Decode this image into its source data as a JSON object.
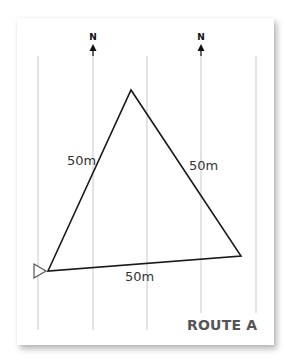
{
  "title": "ROUTE A",
  "colors": {
    "background": "#ffffff",
    "card": "#ffffff",
    "grid_line": "#c8c8c8",
    "route_line": "#1a1a1a",
    "route_title": "#555555",
    "text": "#333333"
  },
  "north_markers": [
    {
      "label": "N",
      "x": 93
    },
    {
      "label": "N",
      "x": 201
    }
  ],
  "grid_lines_x": [
    38,
    93,
    147,
    201,
    256
  ],
  "route": {
    "shape": "triangle",
    "vertices": [
      {
        "name": "start",
        "x": 48,
        "y": 271
      },
      {
        "name": "apex",
        "x": 131,
        "y": 90
      },
      {
        "name": "right",
        "x": 241,
        "y": 256
      }
    ],
    "segments": [
      {
        "name": "left-leg",
        "label": "50m"
      },
      {
        "name": "right-leg",
        "label": "50m"
      },
      {
        "name": "base",
        "label": "50m"
      }
    ],
    "start_marker": "triangle-outline-right"
  }
}
